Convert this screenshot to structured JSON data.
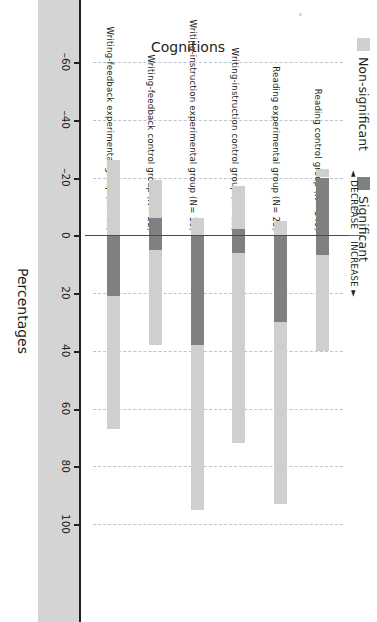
{
  "legend": {
    "items": [
      {
        "label": "Non-significant",
        "color": "#cfcfcf",
        "name": "legend-non-significant"
      },
      {
        "label": "Significant",
        "color": "#808080",
        "name": "legend-significant"
      }
    ]
  },
  "annotations": {
    "decrease": "◄ DECREASE",
    "increase": "INCREASE ►"
  },
  "axes": {
    "value_axis_title": "Percentages",
    "category_axis_title": "Cognitions"
  },
  "chart_data": {
    "type": "bar",
    "orientation": "vertical-rotated",
    "title": "",
    "xlabel": "Cognitions",
    "ylabel": "Percentages",
    "ylim": [
      -60,
      100
    ],
    "yticks": [
      -60,
      -40,
      -20,
      0,
      20,
      40,
      60,
      80,
      100
    ],
    "ytick_labels": [
      "–60",
      "–40",
      "–20",
      "0",
      "20",
      "40",
      "60",
      "80",
      "100"
    ],
    "grid": true,
    "grid_style": "dashed",
    "legend_position": "top-left",
    "stacked": true,
    "categories": [
      "Reading control group (N= 140)",
      "Reading experimental group (N= 23)",
      "Writing-instruction control group (N= 23)",
      "Writing-instruction experimental group (N= 16)",
      "Writing-feedback control group (N= 21)",
      "Writing-feedback experimental group (N= 14)"
    ],
    "series": [
      {
        "name": "Significant",
        "color": "#808080",
        "increase_values": [
          7,
          30,
          6,
          38,
          5,
          21
        ],
        "decrease_values": [
          -20,
          0,
          -2,
          0,
          -6,
          0
        ]
      },
      {
        "name": "Non-significant",
        "color": "#cfcfcf",
        "increase_values": [
          33,
          63,
          66,
          57,
          33,
          46
        ],
        "decrease_values": [
          -3,
          -5,
          -15,
          -6,
          -13,
          -26
        ]
      }
    ],
    "totals": {
      "increase": [
        40,
        93,
        72,
        95,
        38,
        67
      ],
      "decrease": [
        -23,
        -5,
        -17,
        -6,
        -19,
        -26
      ]
    }
  }
}
